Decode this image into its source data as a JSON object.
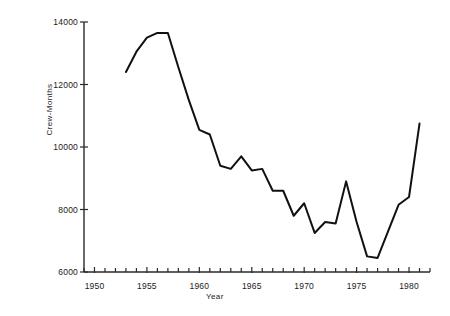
{
  "chart_data": {
    "type": "line",
    "title": "",
    "xlabel": "Year",
    "ylabel": "Crew-Months",
    "xlim": [
      1949,
      1982
    ],
    "ylim": [
      6000,
      14000
    ],
    "grid": false,
    "legend": null,
    "x_major_ticks": [
      1950,
      1955,
      1960,
      1965,
      1970,
      1975,
      1980
    ],
    "x_major_tick_labels": [
      "1950",
      "1955",
      "1960",
      "1965",
      "1970",
      "1975",
      "1980"
    ],
    "x_minor_ticks": [
      1949,
      1951,
      1952,
      1953,
      1954,
      1956,
      1957,
      1958,
      1959,
      1961,
      1962,
      1963,
      1964,
      1966,
      1967,
      1968,
      1969,
      1971,
      1972,
      1973,
      1974,
      1976,
      1977,
      1978,
      1979,
      1981,
      1982
    ],
    "y_ticks": [
      6000,
      8000,
      10000,
      12000,
      14000
    ],
    "y_tick_labels": [
      "6000",
      "8000",
      "10000",
      "12000",
      "14000"
    ],
    "series": [
      {
        "name": "Crew-Months",
        "color": "#111111",
        "x": [
          1953,
          1954,
          1955,
          1956,
          1957,
          1958,
          1959,
          1960,
          1961,
          1962,
          1963,
          1964,
          1965,
          1966,
          1967,
          1968,
          1969,
          1970,
          1971,
          1972,
          1973,
          1974,
          1975,
          1976,
          1977,
          1978,
          1979,
          1980,
          1981
        ],
        "values": [
          12400,
          13050,
          13500,
          13650,
          13650,
          12550,
          11500,
          10550,
          10400,
          9400,
          9300,
          9700,
          9250,
          9300,
          8600,
          8600,
          7800,
          8200,
          7250,
          7600,
          7550,
          8900,
          7600,
          6500,
          6450,
          7300,
          8150,
          8400,
          10750
        ]
      }
    ]
  },
  "axes": {
    "ylabel": "Crew-Months",
    "xlabel": "Year"
  }
}
